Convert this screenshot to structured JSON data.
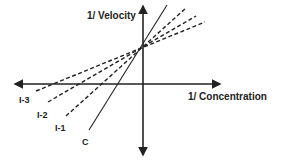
{
  "diagram": {
    "y_axis_label": "1/ Velocity",
    "x_axis_label": "1/ Concentration",
    "lines": [
      {
        "id": "C",
        "label": "C",
        "style": "solid",
        "description": "control (no inhibitor)"
      },
      {
        "id": "I-1",
        "label": "I-1",
        "style": "dashed"
      },
      {
        "id": "I-2",
        "label": "I-2",
        "style": "dashed"
      },
      {
        "id": "I-3",
        "label": "I-3",
        "style": "dashed"
      }
    ],
    "common_intercept": "all lines meet at the same point on the 1/Velocity axis"
  }
}
